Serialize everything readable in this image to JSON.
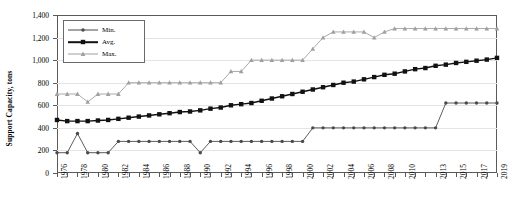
{
  "chart_data": {
    "type": "line",
    "title": "",
    "xlabel": "",
    "ylabel": "Support Capacity, tons",
    "ylim": [
      0,
      1400
    ],
    "ytick_step": 200,
    "ytick_labels": [
      "0",
      "200",
      "400",
      "600",
      "800",
      "1,000",
      "1,200",
      "1,400"
    ],
    "grid": true,
    "legend_position": "top-left",
    "x": [
      1976,
      1977,
      1978,
      1979,
      1980,
      1981,
      1982,
      1983,
      1984,
      1985,
      1986,
      1987,
      1988,
      1989,
      1990,
      1991,
      1992,
      1993,
      1994,
      1995,
      1996,
      1997,
      1998,
      1999,
      2000,
      2001,
      2002,
      2003,
      2004,
      2005,
      2006,
      2007,
      2008,
      2009,
      2010,
      2011,
      2012,
      2013,
      2014,
      2015,
      2016,
      2017,
      2018,
      2019
    ],
    "xtick_labels": [
      "1976",
      "",
      "1978",
      "",
      "1980",
      "",
      "1982",
      "",
      "1984",
      "",
      "1986",
      "",
      "1988",
      "",
      "1990",
      "",
      "1992",
      "",
      "1994",
      "",
      "1996",
      "",
      "1998",
      "",
      "2000",
      "",
      "2002",
      "",
      "2004",
      "",
      "2006",
      "",
      "2008",
      "",
      "2010",
      "",
      "",
      "2013",
      "",
      "2015",
      "",
      "2017",
      "",
      "2019"
    ],
    "series": [
      {
        "name": "Min.",
        "color": "#4a4a4a",
        "marker": "circle",
        "values": [
          180,
          180,
          350,
          180,
          180,
          180,
          280,
          280,
          280,
          280,
          280,
          280,
          280,
          280,
          180,
          280,
          280,
          280,
          280,
          280,
          280,
          280,
          280,
          280,
          280,
          400,
          400,
          400,
          400,
          400,
          400,
          400,
          400,
          400,
          400,
          400,
          400,
          400,
          620,
          620,
          620,
          620,
          620,
          620
        ]
      },
      {
        "name": "Avg.",
        "color": "#111111",
        "marker": "square",
        "values": [
          470,
          460,
          460,
          460,
          465,
          470,
          480,
          490,
          500,
          510,
          520,
          530,
          540,
          545,
          555,
          570,
          580,
          600,
          610,
          620,
          640,
          660,
          680,
          700,
          720,
          740,
          760,
          780,
          800,
          810,
          830,
          850,
          870,
          880,
          900,
          920,
          930,
          950,
          960,
          975,
          985,
          995,
          1005,
          1020
        ]
      },
      {
        "name": "Max.",
        "color": "#a0a0a0",
        "marker": "triangle",
        "values": [
          700,
          700,
          700,
          630,
          700,
          700,
          700,
          800,
          800,
          800,
          800,
          800,
          800,
          800,
          800,
          800,
          800,
          800,
          800,
          800,
          800,
          800,
          800,
          800,
          800,
          800,
          800,
          800,
          800,
          800,
          800,
          800,
          800,
          800,
          800,
          800,
          800,
          800,
          800,
          800,
          800,
          800,
          800,
          800
        ]
      }
    ],
    "legend_entries": [
      "Min.",
      "Avg.",
      "Max."
    ]
  },
  "series_overrides": {
    "min_note": "",
    "avg_note": "",
    "max_note": ""
  },
  "max_actual": [
    700,
    700,
    700,
    630,
    700,
    700,
    700,
    800,
    800,
    800,
    800,
    800,
    800,
    800,
    800,
    800,
    800,
    900,
    900,
    1000,
    1000,
    1000,
    1000,
    1000,
    1000,
    1100,
    1200,
    1250,
    1250,
    1250,
    1250,
    1200,
    1250,
    1280,
    1280,
    1280,
    1280,
    1280,
    1280,
    1280,
    1280,
    1280,
    1280,
    1280
  ],
  "min_actual": [
    180,
    180,
    350,
    180,
    180,
    180,
    280,
    280,
    280,
    280,
    280,
    280,
    280,
    280,
    180,
    280,
    280,
    280,
    280,
    280,
    280,
    280,
    280,
    280,
    280,
    400,
    400,
    400,
    400,
    400,
    400,
    400,
    400,
    400,
    400,
    400,
    400,
    400,
    620,
    620,
    620,
    620,
    620,
    620
  ],
  "avg_actual": [
    470,
    460,
    460,
    460,
    465,
    470,
    480,
    490,
    500,
    510,
    520,
    530,
    540,
    545,
    555,
    570,
    580,
    600,
    610,
    620,
    640,
    660,
    680,
    700,
    720,
    740,
    760,
    780,
    800,
    810,
    830,
    850,
    870,
    880,
    900,
    920,
    930,
    950,
    960,
    975,
    985,
    995,
    1005,
    1020
  ]
}
